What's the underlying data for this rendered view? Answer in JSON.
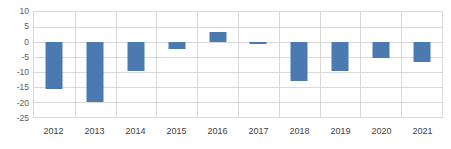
{
  "chart_data": {
    "type": "bar",
    "title": "",
    "subtitle": "",
    "xlabel": "",
    "ylabel": "",
    "categories": [
      "2012",
      "2013",
      "2014",
      "2015",
      "2016",
      "2017",
      "2018",
      "2019",
      "2020",
      "2021"
    ],
    "values": [
      -15.6,
      -20.1,
      -9.7,
      -2.2,
      3.3,
      -0.6,
      -13.0,
      -9.8,
      -5.2,
      -6.8
    ],
    "series": [
      {
        "name": "",
        "values": [
          -15.6,
          -20.1,
          -9.7,
          -2.2,
          3.3,
          -0.6,
          -13.0,
          -9.8,
          -5.2,
          -6.8
        ]
      }
    ],
    "ylim": [
      -25,
      10
    ],
    "ytick_step": 5,
    "yticks": [
      "10",
      "5",
      "0",
      "-5",
      "-10",
      "-15",
      "-20",
      "-25"
    ],
    "ytick_values": [
      10,
      5,
      0,
      -5,
      -10,
      -15,
      -20,
      -25
    ],
    "grid": true,
    "grid_orientation": "both",
    "legend": false,
    "legend_position": "none",
    "bar_color": "#4a7ab0",
    "grid_color": "#d9d9d9",
    "axis_text_color": "#5a5a5a",
    "plot_background": "#ffffff"
  }
}
